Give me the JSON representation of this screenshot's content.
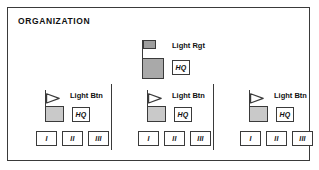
{
  "panel": {
    "title": "ORGANIZATION"
  },
  "regiment": {
    "label": "Light Rgt",
    "flag_icon": "rectangular-flag-filled",
    "hq": "HQ"
  },
  "battalions": [
    {
      "label": "Light Btn",
      "flag_icon": "triangular-pennant-flag",
      "hq": "HQ",
      "companies": [
        "I",
        "II",
        "III"
      ]
    },
    {
      "label": "Light Btn",
      "flag_icon": "triangular-pennant-flag",
      "hq": "HQ",
      "companies": [
        "I",
        "II",
        "III"
      ]
    },
    {
      "label": "Light Btn",
      "flag_icon": "triangular-pennant-flag",
      "hq": "HQ",
      "companies": [
        "I",
        "II",
        "III"
      ]
    }
  ],
  "colors": {
    "border": "#3a3a3a",
    "regiment_fill": "#a9a9a9",
    "battalion_fill": "#c9c9c9",
    "panel_background": "#ffffff",
    "text": "#111111"
  }
}
